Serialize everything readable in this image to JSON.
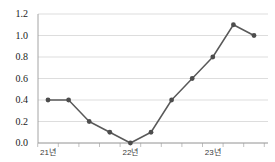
{
  "chart_data": {
    "type": "line",
    "title": "",
    "subtitle": "",
    "xlabel": "",
    "ylabel": "",
    "grid": true,
    "legend": null,
    "ylim": [
      0.0,
      1.2
    ],
    "y_ticks": [
      "0.0",
      "0.2",
      "0.4",
      "0.6",
      "0.8",
      "1.0",
      "1.2"
    ],
    "y_tick_values": [
      0.0,
      0.2,
      0.4,
      0.6,
      0.8,
      1.0,
      1.2
    ],
    "x_tick_labels": [
      "21년",
      "22년",
      "23년"
    ],
    "x_tick_label_indices": [
      0,
      4,
      8
    ],
    "x": [
      0,
      1,
      2,
      3,
      4,
      5,
      6,
      7,
      8,
      9,
      10
    ],
    "values": [
      0.4,
      0.4,
      0.2,
      0.1,
      0.0,
      0.1,
      0.4,
      0.6,
      0.8,
      1.1,
      1.0
    ],
    "n_points": 11,
    "series": [
      {
        "name": "",
        "values": [
          0.4,
          0.4,
          0.2,
          0.1,
          0.0,
          0.1,
          0.4,
          0.6,
          0.8,
          1.1,
          1.0
        ],
        "color": "#595959",
        "marker": "circle"
      }
    ],
    "colors": {
      "line": "#595959",
      "marker": "#4d4d4d",
      "gridline": "#d4d4d4",
      "axis": "#9a9a9a",
      "y_tick_text": "#1a1a1a",
      "x_tick_text": "#3a3a3a",
      "background": "#ffffff"
    },
    "geometry": {
      "plot_left": 38,
      "plot_right": 268,
      "plot_top": 14,
      "plot_bottom": 143,
      "point_spacing": 20.6,
      "first_point_x": 48
    }
  }
}
